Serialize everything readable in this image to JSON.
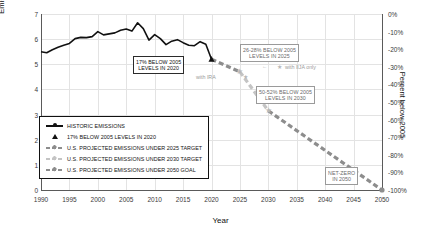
{
  "chart_data": {
    "type": "line",
    "title": "",
    "xlabel": "Year",
    "ylabel": "Emissions (Gigatons CO2 equivalent)",
    "ylabel_right": "Percent below 2005",
    "xlim": [
      1990,
      2050
    ],
    "ylim": [
      0,
      7
    ],
    "ylim_right": [
      -100,
      0
    ],
    "grid": true,
    "legend_position": "lower-left inside",
    "xticks": [
      "1990",
      "1995",
      "2000",
      "2005",
      "2010",
      "2015",
      "2020",
      "2025",
      "2030",
      "2035",
      "2040",
      "2045",
      "2050"
    ],
    "yticks_left": [
      "0",
      "1",
      "2",
      "3",
      "4",
      "5",
      "6",
      "7"
    ],
    "yticks_right": [
      "0%",
      "-10%",
      "-20%",
      "-30%",
      "-40%",
      "-50%",
      "-60%",
      "-70%",
      "-80%",
      "-90%",
      "-100%"
    ],
    "series": [
      {
        "name": "HISTORIC EMISSIONS",
        "style": "solid-black",
        "x": [
          1990,
          1991,
          1992,
          1993,
          1994,
          1995,
          1996,
          1997,
          1998,
          1999,
          2000,
          2001,
          2002,
          2003,
          2004,
          2005,
          2006,
          2007,
          2008,
          2009,
          2010,
          2011,
          2012,
          2013,
          2014,
          2015,
          2016,
          2017,
          2018,
          2019,
          2020
        ],
        "values": [
          5.5,
          5.46,
          5.58,
          5.68,
          5.76,
          5.83,
          6.02,
          6.07,
          6.06,
          6.1,
          6.3,
          6.17,
          6.21,
          6.25,
          6.35,
          6.4,
          6.32,
          6.65,
          6.42,
          5.96,
          6.18,
          6.02,
          5.78,
          5.92,
          5.98,
          5.86,
          5.76,
          5.74,
          5.9,
          5.8,
          5.2
        ]
      },
      {
        "name": "U.S. PROJECTED EMISSIONS UNDER 2025 TARGET",
        "style": "dashed-gray",
        "x": [
          2020,
          2025
        ],
        "values": [
          5.2,
          4.7
        ]
      },
      {
        "name": "U.S. PROJECTED EMISSIONS UNDER 2030 TARGET",
        "style": "dashed-lightgray",
        "x": [
          2025,
          2030
        ],
        "values": [
          4.7,
          3.15
        ]
      },
      {
        "name": "U.S. PROJECTED EMISSIONS UNDER 2050 GOAL",
        "style": "dashed-gray",
        "x": [
          2030,
          2050
        ],
        "values": [
          3.15,
          0.0
        ]
      }
    ],
    "markers": [
      {
        "name": "17% BELOW 2005 LEVELS IN 2020",
        "x": 2020,
        "y": 5.2,
        "shape": "triangle"
      },
      {
        "name": "26-28% BELOW 2005 LEVELS IN 2025",
        "x": 2025,
        "y": 4.7,
        "shape": "star"
      },
      {
        "name": "50-52% BELOW 2005 LEVELS IN 2030",
        "x": 2030,
        "y": 3.15,
        "shape": "star"
      },
      {
        "name": "NET-ZERO IN 2050",
        "x": 2050,
        "y": 0.0,
        "shape": "dot"
      }
    ],
    "annotations": [
      {
        "id": "anno-2020",
        "text_lines": [
          "17% BELOW 2005",
          "LEVELS IN 2020"
        ]
      },
      {
        "id": "anno-2025",
        "text_lines": [
          "26-28% BELOW 2005",
          "LEVELS IN 2025"
        ]
      },
      {
        "id": "anno-2030",
        "text_lines": [
          "50-52% BELOW 2005",
          "LEVELS IN 2030"
        ]
      },
      {
        "id": "anno-netzero",
        "text_lines": [
          "NET-ZERO",
          "IN 2050"
        ]
      },
      {
        "id": "label-ira",
        "text": "with IRA"
      },
      {
        "id": "label-iija",
        "text": "with IIJA only"
      }
    ],
    "legend_entries": [
      {
        "label": "HISTORIC EMISSIONS",
        "key": "solid-line"
      },
      {
        "label": "17% BELOW 2005 LEVELS IN 2020",
        "key": "triangle"
      },
      {
        "label": "U.S. PROJECTED EMISSIONS UNDER 2025 TARGET",
        "key": "dashed-gray"
      },
      {
        "label": "U.S. PROJECTED EMISSIONS UNDER 2030 TARGET",
        "key": "dashed-lightgray"
      },
      {
        "label": "U.S. PROJECTED EMISSIONS UNDER 2050 GOAL",
        "key": "dashed-gray"
      }
    ],
    "colors": {
      "historic": "#111111",
      "projection": "#8d8d8d",
      "projection_light": "#c4c4c4",
      "grid": "#e3e3e3",
      "axis": "#5a5a5a",
      "text": "#111111"
    }
  }
}
